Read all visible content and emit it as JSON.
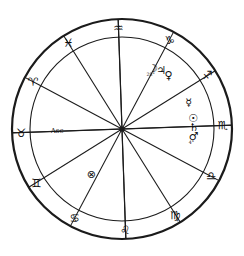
{
  "chart": {
    "type": "astrology-wheel",
    "geometry": {
      "center_x": 122,
      "center_y": 129,
      "outer_radius": 110,
      "inner_radius": 92,
      "sign_label_radius": 101,
      "house_count": 12,
      "sign_count": 12,
      "ring_offset_degrees": 16
    },
    "colors": {
      "stroke": "#1b1b1b",
      "glyph": "#101010",
      "background": "#ffffff"
    },
    "zodiac_signs": [
      {
        "name": "Aquarius",
        "glyph": "♒",
        "angle": 92,
        "label_rotation": 0
      },
      {
        "name": "Pisces",
        "glyph": "♓",
        "angle": 122,
        "label_rotation": 0
      },
      {
        "name": "Aries",
        "glyph": "♈",
        "angle": 152,
        "label_rotation": 0
      },
      {
        "name": "Taurus",
        "glyph": "♉",
        "angle": 182,
        "label_rotation": 0
      },
      {
        "name": "Gemini",
        "glyph": "♊",
        "angle": 212,
        "label_rotation": 0
      },
      {
        "name": "Cancer",
        "glyph": "♋",
        "angle": 242,
        "label_rotation": 0
      },
      {
        "name": "Leo",
        "glyph": "♌",
        "angle": 272,
        "label_rotation": 0
      },
      {
        "name": "Virgo",
        "glyph": "♍",
        "angle": 302,
        "label_rotation": 0
      },
      {
        "name": "Libra",
        "glyph": "♎",
        "angle": 332,
        "label_rotation": 0
      },
      {
        "name": "Scorpio",
        "glyph": "♏",
        "angle": 2,
        "label_rotation": 0
      },
      {
        "name": "Sagittarius",
        "glyph": "♐",
        "angle": 32,
        "label_rotation": 0
      },
      {
        "name": "Capricorn",
        "glyph": "♑",
        "angle": 62,
        "label_rotation": 0
      }
    ],
    "planets": [
      {
        "name": "Moon",
        "glyph": "☽",
        "angle": 63,
        "radius": 68,
        "degree": "28°"
      },
      {
        "name": "Jupiter",
        "glyph": "♃",
        "angle": 56,
        "radius": 70,
        "degree": ""
      },
      {
        "name": "Venus",
        "glyph": "♀",
        "angle": 49,
        "radius": 71,
        "degree": ""
      },
      {
        "name": "Mercury",
        "glyph": "☿",
        "angle": 22,
        "radius": 72,
        "degree": ""
      },
      {
        "name": "Sun",
        "glyph": "☉",
        "angle": 8,
        "radius": 72,
        "degree": ""
      },
      {
        "name": "Saturn",
        "glyph": "♄",
        "angle": 1,
        "radius": 72,
        "degree": ""
      },
      {
        "name": "Mars",
        "glyph": "♂",
        "angle": -6,
        "radius": 72,
        "degree": "4°"
      }
    ],
    "points": [
      {
        "name": "Part of Fortune",
        "glyph": "⊗",
        "angle": 236,
        "radius": 55,
        "label": ""
      },
      {
        "name": "Ascendant",
        "glyph": "",
        "angle": 182,
        "radius": 65,
        "label": "Asc"
      }
    ],
    "house_cusp_angles": [
      2,
      32,
      62,
      92,
      122,
      152,
      182,
      212,
      242,
      272,
      302,
      332
    ],
    "axis_angles": [
      182,
      92
    ]
  }
}
